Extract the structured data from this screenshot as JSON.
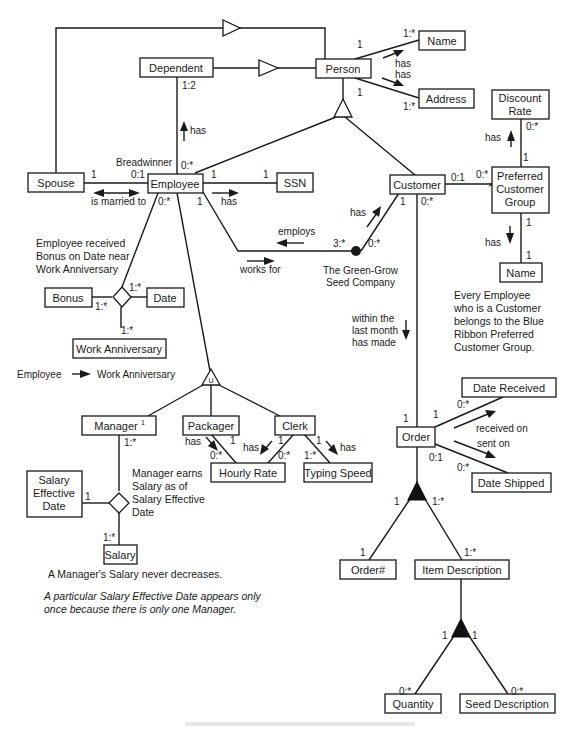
{
  "entities": {
    "name_top": "Name",
    "dependent": "Dependent",
    "person": "Person",
    "address": "Address",
    "discount_rate_1": "Discount",
    "discount_rate_2": "Rate",
    "spouse": "Spouse",
    "employee": "Employee",
    "ssn": "SSN",
    "customer": "Customer",
    "pcg_1": "Preferred",
    "pcg_2": "Customer",
    "pcg_3": "Group",
    "name_pcg": "Name",
    "bonus": "Bonus",
    "date": "Date",
    "work_anniversary": "Work Anniversary",
    "manager": "Manager",
    "manager_sup": "1",
    "packager": "Packager",
    "clerk": "Clerk",
    "hourly_rate": "Hourly Rate",
    "typing_speed": "Typing Speed",
    "salary_eff_1": "Salary",
    "salary_eff_2": "Effective",
    "salary_eff_3": "Date",
    "salary": "Salary",
    "order": "Order",
    "date_received": "Date Received",
    "date_shipped": "Date Shipped",
    "order_num": "Order#",
    "item_description": "Item Description",
    "quantity": "Quantity",
    "seed_description": "Seed Description"
  },
  "relationships": {
    "person_name_has": "has",
    "person_address_has": "has",
    "dependent_has": "has",
    "breadwinner": "Breadwinner",
    "is_married_to": "is married to",
    "employee_ssn_has": "has",
    "employs": "employs",
    "works_for": "works for",
    "customer_company_has": "has",
    "company_1": "The Green-Grow",
    "company_2": "Seed  Company",
    "pcg_discount_has": "has",
    "pcg_name_has": "has",
    "packager_has": "has",
    "clerk_hourly_has": "has",
    "clerk_typing_has": "has",
    "received_on": "received on",
    "sent_on": "sent on",
    "made_1": "within the",
    "made_2": "last month",
    "made_3": "has made",
    "employee_wa_left": "Employee",
    "employee_wa_right": "Work Anniversary",
    "disjoint_symbol": "U"
  },
  "multiplicities": {
    "person_name_1": "1",
    "person_name_many": "1:*",
    "person_address_1": "1",
    "person_address_many": "1:*",
    "dependent_1_2": "1:2",
    "employee_dep_0many": "0:*",
    "spouse_1": "1",
    "employee_spouse_01": "0:1",
    "employee_ssn_1": "1",
    "ssn_1": "1",
    "employee_works_1": "1",
    "employee_bonus_0many": "0:*",
    "company_3many": "3:*",
    "company_customer_0many": "0:*",
    "customer_company_1": "1",
    "customer_pcg_01": "0:1",
    "pcg_customer_0many": "0:*",
    "discount_0many": "0:*",
    "pcg_discount_1": "1",
    "pcg_name_1": "1",
    "name_pcg_1": "1",
    "customer_order_0many": "0:*",
    "bonus_1many": "1:*",
    "date_1many": "1:*",
    "wa_1many": "1:*",
    "manager_salary_1many": "1:*",
    "salary_eff_1": "1",
    "salary_1many": "1:*",
    "packager_1": "1",
    "packager_hr_0many": "0:*",
    "clerk_hr_1": "1",
    "clerk_hr_0many": "0:*",
    "clerk_ts_1": "1",
    "ts_1many": "1:*",
    "order_1_top": "1",
    "order_1_right": "1",
    "order_dr_0many": "0:*",
    "order_01": "0:1",
    "order_ds_0many": "0:*",
    "agg_order_1": "1",
    "agg_item_1many": "1:*",
    "ordernum_1": "1",
    "item_1many": "1:*",
    "agg2_left_1": "1",
    "agg2_right_1": "1",
    "quantity_0many": "0:*",
    "seed_0many": "0:*"
  },
  "notes": {
    "bonus_1": "Employee received",
    "bonus_2": "Bonus on Date near",
    "bonus_3": "Work Anniversary",
    "salary_1": "Manager earns",
    "salary_2": "Salary as of",
    "salary_3": "Salary Effective",
    "salary_4": "Date",
    "pcg_1": "Every Employee",
    "pcg_2": "who is a Customer",
    "pcg_3": "belongs to the Blue",
    "pcg_4": "Ribbon Preferred",
    "pcg_5": "Customer Group.",
    "salary_rule": "A  Manager's Salary never decreases.",
    "eff_date_1": "A particular Salary Effective Date appears only",
    "eff_date_2": "once because there is only one Manager."
  },
  "colors": {
    "ink": "#1a1a1a",
    "background": "#ffffff"
  }
}
